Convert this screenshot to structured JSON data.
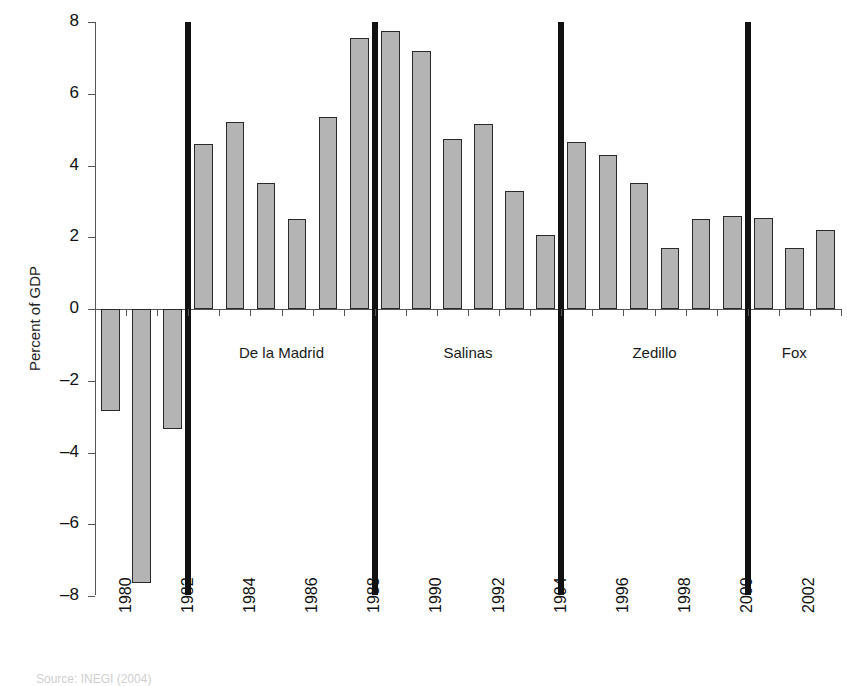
{
  "chart_data": {
    "type": "bar",
    "title": "",
    "xlabel": "",
    "ylabel": "Percent of GDP",
    "ylim": [
      -8,
      8
    ],
    "yticks": [
      8,
      6,
      4,
      2,
      0,
      -2,
      -4,
      -6,
      -8
    ],
    "ytick_labels": [
      "8",
      "6",
      "4",
      "2",
      "0",
      "–2",
      "–4",
      "–6",
      "–8"
    ],
    "grid": false,
    "legend": null,
    "categories": [
      1980,
      1981,
      1982,
      1983,
      1984,
      1985,
      1986,
      1987,
      1988,
      1989,
      1990,
      1991,
      1992,
      1993,
      1994,
      1995,
      1996,
      1997,
      1998,
      1999,
      2000,
      2001,
      2002,
      2003
    ],
    "xtick_labels": [
      "1980",
      "1982",
      "1984",
      "1986",
      "1988",
      "1990",
      "1992",
      "1994",
      "1996",
      "1998",
      "2000",
      "2002"
    ],
    "values": [
      -2.85,
      -7.65,
      -3.35,
      4.6,
      5.2,
      3.5,
      2.5,
      5.35,
      7.55,
      7.75,
      7.2,
      4.75,
      5.15,
      3.3,
      2.05,
      4.65,
      4.3,
      3.5,
      1.7,
      2.5,
      2.6,
      2.55,
      1.7,
      2.2
    ],
    "bar_color": "#b4b4b4",
    "bar_edge_color": "#2a2a2a",
    "annotations": [
      {
        "label": "De la Madrid",
        "start_year": 1983,
        "end_year": 1988
      },
      {
        "label": "Salinas",
        "start_year": 1989,
        "end_year": 1994
      },
      {
        "label": "Zedillo",
        "start_year": 1995,
        "end_year": 2000
      },
      {
        "label": "Fox",
        "start_year": 2001,
        "end_year": 2003
      }
    ],
    "divider_years": [
      1983,
      1989,
      1995,
      2001
    ],
    "divider_color": "#111111",
    "axis_color": "#555555"
  },
  "caption": {
    "source": "Source: INEGI (2004)"
  }
}
